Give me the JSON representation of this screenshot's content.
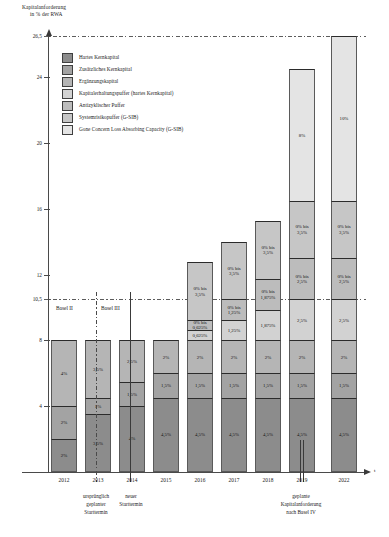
{
  "chart_data": {
    "type": "bar",
    "subtype": "stacked",
    "title": "",
    "ylabel_line1": "Kapitalanforderung",
    "ylabel_line2": "in % der RWA",
    "xlabel": "t",
    "ylim": [
      0,
      26.5
    ],
    "yticks": [
      "0",
      "4",
      "8",
      "10,5",
      "12",
      "16",
      "20",
      "24",
      "26,5"
    ],
    "ytick_values": [
      0,
      4,
      8,
      10.5,
      12,
      16,
      20,
      24,
      26.5
    ],
    "grid": false,
    "reference_lines": [
      {
        "value": 10.5,
        "style": "dash-dot"
      },
      {
        "value": 26.5,
        "style": "dash-dot"
      }
    ],
    "legend_position": "upper-left-inside",
    "legend": [
      {
        "label": "Hartes Kernkapital",
        "color": "#8c8c8c"
      },
      {
        "label": "Zusätzliches Kernkapital",
        "color": "#a3a3a3"
      },
      {
        "label": "Ergänzungskapital",
        "color": "#b5b5b5"
      },
      {
        "label": "Kapitalerhaltungspuffer (hartes Kernkapital)",
        "color": "#d2d2d2"
      },
      {
        "label": "Antizyklischer Puffer",
        "color": "#bcbcbc"
      },
      {
        "label": "Systemrisikopuffer (G-SIB)",
        "color": "#c6c6c6"
      },
      {
        "label": "Gone Concern Loss Absorbing Capacity (G-SIB)",
        "color": "#e4e4e4"
      }
    ],
    "categories": [
      "2012",
      "2013",
      "2014",
      "2015",
      "2016",
      "2017",
      "2018",
      "2019",
      "2022"
    ],
    "series": [
      {
        "name": "Hartes Kernkapital",
        "values": [
          2,
          3.5,
          4,
          4.5,
          4.5,
          4.5,
          4.5,
          4.5,
          4.5
        ]
      },
      {
        "name": "Zusätzliches Kernkapital",
        "values": [
          2,
          1,
          1.5,
          1.5,
          1.5,
          1.5,
          1.5,
          1.5,
          1.5
        ]
      },
      {
        "name": "Ergänzungskapital",
        "values": [
          4,
          3.5,
          2.5,
          2,
          2,
          2,
          2,
          2,
          2
        ]
      },
      {
        "name": "Kapitalerhaltungspuffer (hartes Kernkapital)",
        "values": [
          0,
          0,
          0,
          0,
          0.625,
          1.25,
          1.875,
          2.5,
          2.5
        ]
      },
      {
        "name": "Antizyklischer Puffer",
        "values": [
          0,
          0,
          0,
          0,
          0.625,
          1.25,
          1.875,
          2.5,
          2.5
        ]
      },
      {
        "name": "Systemrisikopuffer (G-SIB)",
        "values": [
          0,
          0,
          0,
          0,
          3.5,
          3.5,
          3.5,
          3.5,
          3.5
        ]
      },
      {
        "name": "Gone Concern Loss Absorbing Capacity (G-SIB)",
        "values": [
          0,
          0,
          0,
          0,
          0,
          0,
          0,
          8,
          10
        ]
      }
    ],
    "bar_totals": [
      8,
      8,
      8,
      8,
      12.75,
      14,
      15.375,
      24.5,
      26.5
    ]
  },
  "axis": {
    "title_line1": "Kapitalanforderung",
    "title_line2": "in % der RWA",
    "x_end_label": "t"
  },
  "legend": {
    "items": [
      {
        "label": "Hartes Kernkapital"
      },
      {
        "label": "Zusätzliches Kernkapital"
      },
      {
        "label": "Ergänzungskapital"
      },
      {
        "label": "Kapitalerhaltungspuffer (hartes Kernkapital)"
      },
      {
        "label": "Antizyklischer Puffer"
      },
      {
        "label": "Systemrisikopuffer (G-SIB)"
      },
      {
        "label": "Gone Concern Loss Absorbing Capacity (G-SIB)"
      }
    ]
  },
  "yaxis": {
    "ticks": [
      {
        "label": "26,5"
      },
      {
        "label": "24"
      },
      {
        "label": "20"
      },
      {
        "label": "16"
      },
      {
        "label": "12"
      },
      {
        "label": "10,5"
      },
      {
        "label": "8"
      },
      {
        "label": "4"
      }
    ]
  },
  "bars": [
    {
      "year": "2012",
      "segments": [
        {
          "type": "ergaenzungskapital",
          "label": "4%"
        },
        {
          "type": "zusaetzliches-kernkapital",
          "label": "2%"
        },
        {
          "type": "hartes-kernkapital",
          "label": "2%"
        }
      ]
    },
    {
      "year": "2013",
      "segments": [
        {
          "type": "ergaenzungskapital",
          "label": "3,5%"
        },
        {
          "type": "zusaetzliches-kernkapital",
          "label": "1%"
        },
        {
          "type": "hartes-kernkapital",
          "label": "3,5%"
        }
      ]
    },
    {
      "year": "2014",
      "segments": [
        {
          "type": "ergaenzungskapital",
          "label": "2,5%"
        },
        {
          "type": "zusaetzliches-kernkapital",
          "label": "1,5%"
        },
        {
          "type": "hartes-kernkapital",
          "label": "4%"
        }
      ]
    },
    {
      "year": "2015",
      "segments": [
        {
          "type": "ergaenzungskapital",
          "label": "2%"
        },
        {
          "type": "zusaetzliches-kernkapital",
          "label": "1,5%"
        },
        {
          "type": "hartes-kernkapital",
          "label": "4,5%"
        }
      ]
    },
    {
      "year": "2016",
      "segments": [
        {
          "type": "systemrisikopuffer",
          "label": "0% bis\n3,5%"
        },
        {
          "type": "antizyklischer-puffer",
          "label": "0% bis\n0,625%"
        },
        {
          "type": "kapitalerhaltungspuffer",
          "label": "0,625%"
        },
        {
          "type": "ergaenzungskapital",
          "label": "2%"
        },
        {
          "type": "zusaetzliches-kernkapital",
          "label": "1,5%"
        },
        {
          "type": "hartes-kernkapital",
          "label": "4,5%"
        }
      ]
    },
    {
      "year": "2017",
      "segments": [
        {
          "type": "systemrisikopuffer",
          "label": "0% bis\n3,5%"
        },
        {
          "type": "antizyklischer-puffer",
          "label": "0% bis\n1,25%"
        },
        {
          "type": "kapitalerhaltungspuffer",
          "label": "1,25%"
        },
        {
          "type": "ergaenzungskapital",
          "label": "2%"
        },
        {
          "type": "zusaetzliches-kernkapital",
          "label": "1,5%"
        },
        {
          "type": "hartes-kernkapital",
          "label": "4,5%"
        }
      ]
    },
    {
      "year": "2018",
      "segments": [
        {
          "type": "systemrisikopuffer",
          "label": "0% bis\n3,5%"
        },
        {
          "type": "antizyklischer-puffer",
          "label": "0% bis\n1,875%"
        },
        {
          "type": "kapitalerhaltungspuffer",
          "label": "1,875%"
        },
        {
          "type": "ergaenzungskapital",
          "label": "2%"
        },
        {
          "type": "zusaetzliches-kernkapital",
          "label": "1,5%"
        },
        {
          "type": "hartes-kernkapital",
          "label": "4,5%"
        }
      ]
    },
    {
      "year": "2019",
      "segments": [
        {
          "type": "gclac",
          "label": "8%"
        },
        {
          "type": "systemrisikopuffer",
          "label": "0% bis\n3,5%"
        },
        {
          "type": "antizyklischer-puffer",
          "label": "0% bis\n2,5%"
        },
        {
          "type": "kapitalerhaltungspuffer",
          "label": "2,5%"
        },
        {
          "type": "ergaenzungskapital",
          "label": "2%"
        },
        {
          "type": "zusaetzliches-kernkapital",
          "label": "1,5%"
        },
        {
          "type": "hartes-kernkapital",
          "label": "4,5%"
        }
      ]
    },
    {
      "year": "2022",
      "segments": [
        {
          "type": "gclac",
          "label": "10%"
        },
        {
          "type": "systemrisikopuffer",
          "label": "0% bis\n3,5%"
        },
        {
          "type": "antizyklischer-puffer",
          "label": "0% bis\n2,5%"
        },
        {
          "type": "kapitalerhaltungspuffer",
          "label": "2,5%"
        },
        {
          "type": "ergaenzungskapital",
          "label": "2%"
        },
        {
          "type": "zusaetzliches-kernkapital",
          "label": "1,5%"
        },
        {
          "type": "hartes-kernkapital",
          "label": "4,5%"
        }
      ]
    }
  ],
  "regime_labels": {
    "basel_ii": "Basel II",
    "basel_iii": "Basel III"
  },
  "xaxis": {
    "labels": [
      "2012",
      "2013",
      "2014",
      "2015",
      "2016",
      "2017",
      "2018",
      "2019",
      "2022"
    ],
    "notes": [
      {
        "text": "ursprünglich\ngeplanter\nStarttermin"
      },
      {
        "text": "neuer\nStarttermin"
      },
      {
        "text": "geplante\nKapitalanforderung\nnach Basel IV"
      }
    ]
  }
}
